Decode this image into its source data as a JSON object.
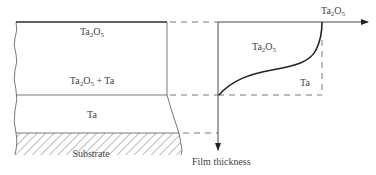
{
  "diagram": {
    "left_panel": {
      "layers": [
        {
          "name": "Ta2O5",
          "label_main": "Ta",
          "label_sub": "2",
          "label_mid": "O",
          "label_sub2": "5",
          "label_tail": ""
        },
        {
          "name": "Ta2O5 + Ta",
          "label_main": "Ta",
          "label_sub": "2",
          "label_mid": "O",
          "label_sub2": "5",
          "label_tail": " + Ta"
        },
        {
          "name": "Ta",
          "label": "Ta"
        },
        {
          "name": "Substrate",
          "label": "Substrate"
        }
      ]
    },
    "right_panel": {
      "x_axis_label_main": "Ta",
      "x_axis_label_sub": "2",
      "x_axis_label_mid": "O",
      "x_axis_label_sub2": "5",
      "y_axis_label": "Film thickness",
      "region_upper_main": "Ta",
      "region_upper_sub": "2",
      "region_upper_mid": "O",
      "region_upper_sub2": "5",
      "region_lower": "Ta"
    },
    "colors": {
      "line": "#3a3a3a",
      "text": "#444444",
      "hatch": "#555555"
    }
  }
}
